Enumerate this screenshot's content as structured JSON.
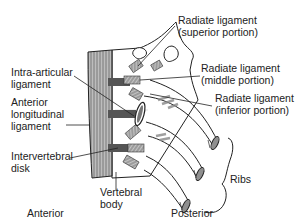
{
  "diagram": {
    "labels": {
      "radiate_superior_1": "Radiate ligament",
      "radiate_superior_2": "(superior portion)",
      "radiate_middle_1": "Radiate ligament",
      "radiate_middle_2": "(middle portion)",
      "radiate_inferior_1": "Radiate ligament",
      "radiate_inferior_2": "(inferior portion)",
      "intra_articular_1": "Intra-articular",
      "intra_articular_2": "ligament",
      "anterior_long_1": "Anterior",
      "anterior_long_2": "longitudinal",
      "anterior_long_3": "ligament",
      "intervertebral_1": "Intervertebral",
      "intervertebral_2": "disk",
      "vertebral_body_1": "Vertebral",
      "vertebral_body_2": "body",
      "ribs": "Ribs",
      "anterior": "Anterior",
      "posterior": "Posterior"
    },
    "colors": {
      "line": "#222222",
      "ligament_fill": "#9a9a9a",
      "dark_fill": "#555555",
      "background": "#ffffff"
    }
  }
}
